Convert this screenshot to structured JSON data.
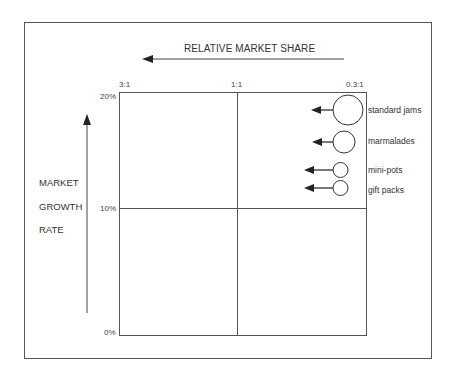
{
  "diagram": {
    "x_axis": {
      "label": "RELATIVE MARKET SHARE",
      "direction": "right-to-left",
      "ticks": [
        "3:1",
        "1:1",
        "0.3:1"
      ]
    },
    "y_axis": {
      "label_lines": [
        "MARKET",
        "GROWTH",
        "RATE"
      ],
      "direction": "bottom-to-top",
      "ticks": [
        "20%",
        "10%",
        "0%"
      ]
    },
    "bubbles": [
      {
        "label": "standard jams",
        "radius": 15,
        "relative_share": "0.3:1",
        "growth": "≈18%",
        "arrow": "left"
      },
      {
        "label": "marmalades",
        "radius": 11,
        "relative_share": "0.3:1",
        "growth": "≈16%",
        "arrow": "left"
      },
      {
        "label": "mini-pots",
        "radius": 7.5,
        "relative_share": "0.3:1",
        "growth": "≈13.5%",
        "arrow": "left"
      },
      {
        "label": "gift packs",
        "radius": 7.5,
        "relative_share": "0.3:1",
        "growth": "≈12%",
        "arrow": "left"
      }
    ],
    "colors": {
      "line": "#444444",
      "frame": "#555555",
      "text": "#333333",
      "background": "#ffffff"
    }
  }
}
